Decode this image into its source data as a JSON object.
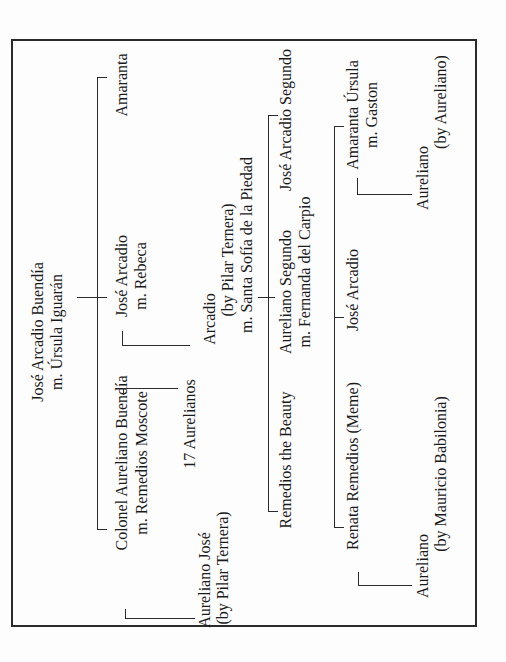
{
  "diagram": {
    "type": "family-tree",
    "orientation": "rotated -90deg (reads bottom-to-top)",
    "root": {
      "name": "José Arcadio Buendía",
      "spouse": "m. Úrsula Iguarán"
    },
    "generation_2": [
      {
        "name": "Amaranta"
      },
      {
        "name": "José Arcadio",
        "spouse": "m. Rebeca"
      },
      {
        "name": "Colonel Aureliano Buendía",
        "spouse": "m. Remedios Moscote"
      }
    ],
    "generation_2_children": [
      {
        "name": "17 Aurelianos"
      },
      {
        "name": "Aureliano José",
        "note": "(by Pilar Ternera)"
      },
      {
        "name": "Arcadio",
        "note": "(by Pilar Ternera)",
        "spouse": "m. Santa Sofía de la Piedad"
      }
    ],
    "generation_3": [
      {
        "name": "José Arcadio Segundo"
      },
      {
        "name": "Aureliano Segundo",
        "spouse": "m. Fernanda del Carpio"
      },
      {
        "name": "Remedios the Beauty"
      }
    ],
    "generation_4": [
      {
        "name": "Amaranta Úrsula",
        "spouse": "m. Gaston"
      },
      {
        "name": "José Arcadio"
      },
      {
        "name": "Renata Remedios (Meme)"
      }
    ],
    "generation_5": [
      {
        "name": "Aureliano",
        "note": "(by Aureliano)"
      },
      {
        "name": "Aureliano",
        "note": "(by Mauricio Babilonia)"
      }
    ]
  }
}
